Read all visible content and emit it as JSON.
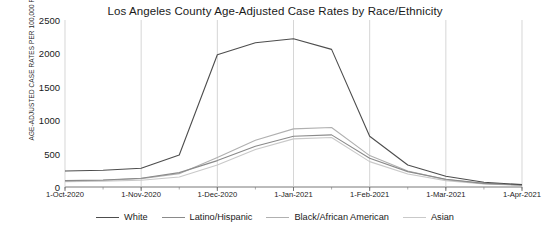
{
  "chart_data": {
    "type": "line",
    "title": "Los Angeles County Age-Adjusted Case Rates by Race/Ethnicity",
    "xlabel": "",
    "ylabel": "AGE-ADJUSTED CASE RATES PER 100,000 PER 14 DAY CUMULATIVE'",
    "ylim": [
      0,
      2500
    ],
    "yticks": [
      0,
      500,
      1000,
      1500,
      2000,
      2500
    ],
    "ytick_labels": [
      "0",
      "500",
      "1000",
      "1500",
      "2000",
      "2500"
    ],
    "xticks": [
      "1-Oct-2020",
      "1-Nov-2020",
      "1-Dec-2020",
      "1-Jan-2021",
      "1-Feb-2021",
      "1-Mar-2021",
      "1-Apr-2021"
    ],
    "grid": "vertical-only",
    "legend_position": "bottom",
    "x": [
      "1-Oct-2020",
      "15-Oct-2020",
      "1-Nov-2020",
      "15-Nov-2020",
      "1-Dec-2020",
      "15-Dec-2020",
      "1-Jan-2021",
      "15-Jan-2021",
      "1-Feb-2021",
      "15-Feb-2021",
      "1-Mar-2021",
      "15-Mar-2021",
      "1-Apr-2021"
    ],
    "series": [
      {
        "name": "White",
        "color": "#4d4d4d",
        "values": [
          240,
          250,
          280,
          480,
          1980,
          2160,
          2220,
          2060,
          760,
          330,
          160,
          70,
          35
        ]
      },
      {
        "name": "Latino/Hispanic",
        "color": "#8a8a8a",
        "values": [
          95,
          105,
          130,
          215,
          395,
          610,
          760,
          780,
          430,
          230,
          115,
          55,
          30
        ]
      },
      {
        "name": "Black/African American",
        "color": "#b0b0b0",
        "values": [
          90,
          100,
          125,
          200,
          440,
          700,
          870,
          890,
          470,
          240,
          110,
          50,
          28
        ]
      },
      {
        "name": "Asian",
        "color": "#c9c9c9",
        "values": [
          80,
          88,
          100,
          150,
          330,
          560,
          720,
          740,
          380,
          195,
          95,
          45,
          25
        ]
      }
    ]
  }
}
